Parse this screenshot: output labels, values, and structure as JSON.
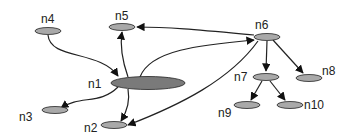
{
  "diagram": {
    "type": "directed-graph",
    "colors": {
      "background": "#ffffff",
      "node_fill": "#a9a9a9",
      "hub_fill": "#7a7a7a",
      "stroke": "#222222",
      "label": "#222222"
    },
    "nodes": [
      {
        "id": "n1",
        "label": "n1",
        "cx": 148,
        "cy": 83,
        "rx": 37,
        "ry": 6.5,
        "lx": 88,
        "ly": 88,
        "hub": true
      },
      {
        "id": "n2",
        "label": "n2",
        "cx": 114,
        "cy": 125,
        "rx": 13,
        "ry": 3.5,
        "lx": 84,
        "ly": 132
      },
      {
        "id": "n3",
        "label": "n3",
        "cx": 55,
        "cy": 110,
        "rx": 13,
        "ry": 3.5,
        "lx": 19,
        "ly": 121
      },
      {
        "id": "n4",
        "label": "n4",
        "cx": 48,
        "cy": 31,
        "rx": 13,
        "ry": 3.5,
        "lx": 41,
        "ly": 23
      },
      {
        "id": "n5",
        "label": "n5",
        "cx": 122,
        "cy": 27,
        "rx": 13,
        "ry": 3.5,
        "lx": 115,
        "ly": 20
      },
      {
        "id": "n6",
        "label": "n6",
        "cx": 267,
        "cy": 37,
        "rx": 13,
        "ry": 3.5,
        "lx": 255,
        "ly": 29
      },
      {
        "id": "n7",
        "label": "n7",
        "cx": 266,
        "cy": 77,
        "rx": 13,
        "ry": 3.5,
        "lx": 234,
        "ly": 81
      },
      {
        "id": "n8",
        "label": "n8",
        "cx": 309,
        "cy": 78,
        "rx": 13,
        "ry": 3.5,
        "lx": 322,
        "ly": 75
      },
      {
        "id": "n9",
        "label": "n9",
        "cx": 247,
        "cy": 105,
        "rx": 13,
        "ry": 3.5,
        "lx": 218,
        "ly": 117
      },
      {
        "id": "n10",
        "label": "n10",
        "cx": 290,
        "cy": 105,
        "rx": 13,
        "ry": 3.5,
        "lx": 304,
        "ly": 109
      }
    ],
    "edges": [
      {
        "from": "n4",
        "to": "n1",
        "d": "M48,35 C50,60 100,50 118,76"
      },
      {
        "from": "n1",
        "to": "n5",
        "d": "M128,77 C122,60 120,45 122,32"
      },
      {
        "from": "n1",
        "to": "n3",
        "d": "M118,87 C100,105 80,95 61,108"
      },
      {
        "from": "n1",
        "to": "n2",
        "d": "M128,89 C130,100 128,110 121,121"
      },
      {
        "from": "n6",
        "to": "n5",
        "d": "M254,35 C200,30 170,27 137,27"
      },
      {
        "from": "n1",
        "to": "n6",
        "d": "M140,77 C150,50 200,45 254,40"
      },
      {
        "from": "n6",
        "to": "n2",
        "d": "M258,41 C230,80 180,105 128,125"
      },
      {
        "from": "n6",
        "to": "n7",
        "d": "M267,41 L266,71"
      },
      {
        "from": "n6",
        "to": "n8",
        "d": "M273,40 L303,73"
      },
      {
        "from": "n7",
        "to": "n9",
        "d": "M262,81 L251,100"
      },
      {
        "from": "n7",
        "to": "n10",
        "d": "M270,81 L285,100"
      }
    ]
  }
}
